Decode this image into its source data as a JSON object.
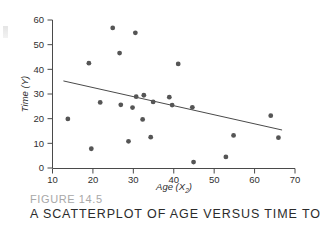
{
  "figure": {
    "number_label": "FIGURE 14.5",
    "title": "A SCATTERPLOT OF AGE VERSUS TIME TO RELIEF.",
    "axis_color": "#4a4a4a",
    "point_color": "#555555",
    "line_color": "#4a4a4a",
    "caption_number_color": "#a8a8a8",
    "caption_title_color": "#2b2b2b"
  },
  "axes": {
    "x_label_text": "Age (X",
    "x_label_sub": "2",
    "x_label_close": ")",
    "y_label_text": "Time (Y)",
    "x_ticks": [
      "10",
      "20",
      "30",
      "40",
      "50",
      "60",
      "70"
    ],
    "y_ticks": [
      "0",
      "10",
      "20",
      "30",
      "40",
      "50",
      "60"
    ]
  },
  "chart_data": {
    "type": "scatter",
    "title": "A SCATTERPLOT OF AGE VERSUS TIME TO RELIEF.",
    "xlabel": "Age (X2)",
    "ylabel": "Time (Y)",
    "xlim": [
      10,
      70
    ],
    "ylim": [
      0,
      60
    ],
    "xticks": [
      10,
      20,
      30,
      40,
      50,
      60,
      70
    ],
    "yticks": [
      0,
      10,
      20,
      30,
      40,
      50,
      60
    ],
    "grid": false,
    "legend": false,
    "points": [
      {
        "x": 13.8,
        "y": 19.9
      },
      {
        "x": 19.0,
        "y": 42.5
      },
      {
        "x": 19.6,
        "y": 7.8
      },
      {
        "x": 21.8,
        "y": 26.6
      },
      {
        "x": 24.9,
        "y": 56.8
      },
      {
        "x": 26.6,
        "y": 46.6
      },
      {
        "x": 26.9,
        "y": 25.6
      },
      {
        "x": 28.8,
        "y": 10.8
      },
      {
        "x": 29.8,
        "y": 24.5
      },
      {
        "x": 30.5,
        "y": 54.8
      },
      {
        "x": 30.7,
        "y": 28.9
      },
      {
        "x": 32.3,
        "y": 19.7
      },
      {
        "x": 32.6,
        "y": 29.5
      },
      {
        "x": 34.3,
        "y": 12.5
      },
      {
        "x": 34.9,
        "y": 26.8
      },
      {
        "x": 38.9,
        "y": 28.7
      },
      {
        "x": 39.6,
        "y": 25.5
      },
      {
        "x": 41.1,
        "y": 42.2
      },
      {
        "x": 44.6,
        "y": 24.6
      },
      {
        "x": 44.9,
        "y": 2.4
      },
      {
        "x": 52.9,
        "y": 4.5
      },
      {
        "x": 54.8,
        "y": 13.2
      },
      {
        "x": 64.0,
        "y": 21.2
      },
      {
        "x": 65.9,
        "y": 12.3
      }
    ],
    "fit_line": {
      "label": "least-squares regression line",
      "x_start": 12.7,
      "y_start": 35.3,
      "x_end": 66.8,
      "y_end": 15.4
    }
  }
}
